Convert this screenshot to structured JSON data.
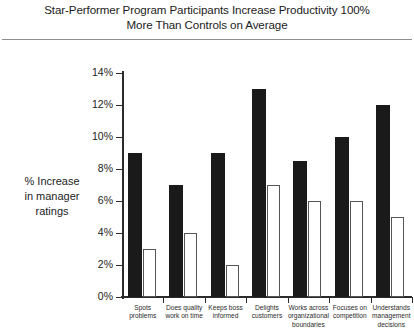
{
  "title": {
    "line1": "Star-Performer Program Participants Increase Productivity 100%",
    "line2": "More Than Controls on Average"
  },
  "axis_label": {
    "line1": "% Increase",
    "line2": "in manager",
    "line3": "ratings"
  },
  "chart_data": {
    "type": "bar",
    "title": "Star-Performer Program Participants Increase Productivity 100% More Than Controls on Average",
    "xlabel": "",
    "ylabel": "% Increase in manager ratings",
    "ylim": [
      0,
      14
    ],
    "ytick_labels": [
      "0%",
      "2%",
      "4%",
      "6%",
      "8%",
      "10%",
      "12%",
      "14%"
    ],
    "ytick_values": [
      0,
      2,
      4,
      6,
      8,
      10,
      12,
      14
    ],
    "grid": false,
    "legend": "none",
    "categories": [
      "Spots problems",
      "Does quality work on time",
      "Keeps boss informed",
      "Delights customers",
      "Works across organizational boundaries",
      "Focuses on competition",
      "Understands management decisions"
    ],
    "category_lines": [
      [
        "Spots",
        "problems"
      ],
      [
        "Does quality",
        "work on time"
      ],
      [
        "Keeps boss",
        "informed"
      ],
      [
        "Delights",
        "customers"
      ],
      [
        "Works across",
        "organizational",
        "boundaries"
      ],
      [
        "Focuses on",
        "competition"
      ],
      [
        "Understands",
        "management",
        "decisions"
      ]
    ],
    "series": [
      {
        "name": "Star performers",
        "color": "#1a1a1a",
        "values": [
          9,
          7,
          9,
          13,
          8.5,
          10,
          12
        ]
      },
      {
        "name": "Controls",
        "color": "#ffffff",
        "values": [
          3,
          4,
          2,
          7,
          6,
          6,
          5
        ]
      }
    ]
  }
}
